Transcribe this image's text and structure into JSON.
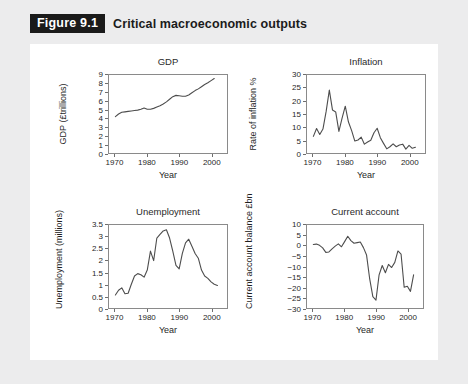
{
  "header": {
    "badge": "Figure 9.1",
    "caption": "Critical macroeconomic outputs"
  },
  "colors": {
    "page_background": "#ececed",
    "panel_background": "#ffffff",
    "badge_background": "#1a1a1a",
    "badge_text": "#ffffff",
    "line": "#4d4d4d",
    "frame": "#8a8a8a"
  },
  "charts": [
    {
      "id": "gdp",
      "title": "GDP",
      "type": "line",
      "xlabel": "Year",
      "ylabel": "GDP (£trillions)",
      "xlim": [
        1968,
        2005
      ],
      "ylim": [
        0,
        9
      ],
      "xticks": [
        1970,
        1980,
        1990,
        2000
      ],
      "xticklabels": [
        "1970",
        "1980",
        "1990",
        "2000"
      ],
      "yticks": [
        0,
        1,
        2,
        3,
        4,
        5,
        6,
        7,
        8,
        9
      ],
      "yticklabels": [
        "0",
        "1",
        "2",
        "3",
        "4",
        "5",
        "6",
        "7",
        "8",
        "9"
      ],
      "grid": false,
      "legend": false,
      "x": [
        1970,
        1971,
        1972,
        1973,
        1974,
        1975,
        1976,
        1977,
        1978,
        1979,
        1980,
        1981,
        1982,
        1983,
        1984,
        1985,
        1986,
        1987,
        1988,
        1989,
        1990,
        1991,
        1992,
        1993,
        1994,
        1995,
        1996,
        1997,
        1998,
        1999,
        2000,
        2001
      ],
      "y": [
        4.2,
        4.5,
        4.7,
        4.75,
        4.8,
        4.85,
        4.9,
        4.95,
        5.05,
        5.2,
        5.05,
        5.05,
        5.15,
        5.3,
        5.45,
        5.65,
        5.9,
        6.2,
        6.5,
        6.65,
        6.6,
        6.55,
        6.55,
        6.7,
        6.95,
        7.2,
        7.4,
        7.65,
        7.9,
        8.1,
        8.35,
        8.6
      ]
    },
    {
      "id": "inflation",
      "title": "Inflation",
      "type": "line",
      "xlabel": "Year",
      "ylabel": "Rate of inflation %",
      "xlim": [
        1968,
        2005
      ],
      "ylim": [
        0,
        30
      ],
      "xticks": [
        1970,
        1980,
        1990,
        2000
      ],
      "xticklabels": [
        "1970",
        "1980",
        "1990",
        "2000"
      ],
      "yticks": [
        0,
        5,
        10,
        15,
        20,
        25,
        30
      ],
      "yticklabels": [
        "0",
        "5",
        "10",
        "15",
        "20",
        "25",
        "30"
      ],
      "grid": false,
      "legend": false,
      "x": [
        1970,
        1971,
        1972,
        1973,
        1974,
        1975,
        1976,
        1977,
        1978,
        1979,
        1980,
        1981,
        1982,
        1983,
        1984,
        1985,
        1986,
        1987,
        1988,
        1989,
        1990,
        1991,
        1992,
        1993,
        1994,
        1995,
        1996,
        1997,
        1998,
        1999,
        2000,
        2001,
        2002
      ],
      "y": [
        6.4,
        9.4,
        7.1,
        9.2,
        16.0,
        24.2,
        16.5,
        15.8,
        8.3,
        13.4,
        18.0,
        11.9,
        8.6,
        4.6,
        5.0,
        6.1,
        3.4,
        4.2,
        4.9,
        7.8,
        9.5,
        5.9,
        3.7,
        1.6,
        2.4,
        3.5,
        2.4,
        3.1,
        3.4,
        1.5,
        2.9,
        1.8,
        2.2
      ]
    },
    {
      "id": "unemployment",
      "title": "Unemployment",
      "type": "line",
      "xlabel": "Year",
      "ylabel": "Unemployment (millions)",
      "xlim": [
        1968,
        2005
      ],
      "ylim": [
        0,
        3.5
      ],
      "xticks": [
        1970,
        1980,
        1990,
        2000
      ],
      "xticklabels": [
        "1970",
        "1980",
        "1990",
        "2000"
      ],
      "yticks": [
        0,
        0.5,
        1,
        1.5,
        2,
        2.5,
        3,
        3.5
      ],
      "yticklabels": [
        "0",
        "0.5",
        "1",
        "1.5",
        "2",
        "2.5",
        "3",
        "3.5"
      ],
      "grid": false,
      "legend": false,
      "x": [
        1970,
        1971,
        1972,
        1973,
        1974,
        1975,
        1976,
        1977,
        1978,
        1979,
        1980,
        1981,
        1982,
        1983,
        1984,
        1985,
        1986,
        1987,
        1988,
        1989,
        1990,
        1991,
        1992,
        1993,
        1994,
        1995,
        1996,
        1997,
        1998,
        1999,
        2000,
        2001,
        2002
      ],
      "y": [
        0.55,
        0.75,
        0.85,
        0.6,
        0.62,
        1.0,
        1.35,
        1.45,
        1.4,
        1.3,
        1.6,
        2.4,
        2.0,
        2.95,
        3.1,
        3.25,
        3.3,
        2.95,
        2.4,
        1.8,
        1.65,
        2.3,
        2.75,
        2.9,
        2.6,
        2.3,
        2.1,
        1.6,
        1.35,
        1.25,
        1.1,
        1.0,
        0.95
      ]
    },
    {
      "id": "current-account",
      "title": "Current account",
      "type": "line",
      "xlabel": "Year",
      "ylabel": "Current account balance £bn",
      "xlim": [
        1968,
        2005
      ],
      "ylim": [
        -30,
        10
      ],
      "xticks": [
        1970,
        1980,
        1990,
        2000
      ],
      "xticklabels": [
        "1970",
        "1980",
        "1990",
        "2000"
      ],
      "yticks": [
        -30,
        -25,
        -20,
        -15,
        -10,
        -5,
        0,
        5,
        10
      ],
      "yticklabels": [
        "−30",
        "−25",
        "−20",
        "−15",
        "−10",
        "−5",
        "0",
        "5",
        "10"
      ],
      "grid": false,
      "legend": false,
      "x": [
        1970,
        1971,
        1972,
        1973,
        1974,
        1975,
        1976,
        1977,
        1978,
        1979,
        1980,
        1981,
        1982,
        1983,
        1984,
        1985,
        1986,
        1987,
        1988,
        1989,
        1990,
        1991,
        1992,
        1993,
        1994,
        1995,
        1996,
        1997,
        1998,
        1999,
        2000,
        2001,
        2002
      ],
      "y": [
        0.6,
        0.8,
        0.2,
        -1.0,
        -3.2,
        -3.0,
        -1.5,
        -0.2,
        0.9,
        -0.5,
        2.0,
        4.6,
        2.5,
        1.2,
        1.5,
        1.8,
        -0.9,
        -4.5,
        -16.0,
        -24.5,
        -26.2,
        -14.0,
        -9.5,
        -13.0,
        -9.0,
        -10.5,
        -8.0,
        -2.5,
        -4.0,
        -20.0,
        -19.5,
        -22.0,
        -14.0
      ]
    }
  ]
}
